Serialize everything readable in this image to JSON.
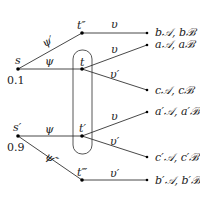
{
  "diagram": {
    "type": "game-tree",
    "nodes": {
      "s": {
        "label": "s",
        "prob": "0.1"
      },
      "s_prime": {
        "label": "s′",
        "prob": "0.9"
      },
      "t": {
        "label": "t"
      },
      "t_prime": {
        "label": "t′"
      },
      "t_dprime": {
        "label": "t″"
      },
      "t_tprime": {
        "label": "t‴"
      }
    },
    "edges": {
      "s_to_tdprime": "ψ′",
      "s_to_t": "ψ",
      "sprime_to_tprime": "ψ",
      "sprime_to_ttprime": "ψ″",
      "tdprime_to_b": "υ",
      "t_to_a": "υ",
      "t_to_c": "υ′",
      "tprime_to_aprime": "υ",
      "tprime_to_cprime": "υ′",
      "ttprime_to_bprime": "υ′"
    },
    "leaves": {
      "b": "b𝒜, bℬ",
      "a": "a𝒜, aℬ",
      "c": "c𝒜, cℬ",
      "a_prime": "a′𝒜, a′ℬ",
      "c_prime": "c′𝒜, c′ℬ",
      "b_prime": "b′𝒜, b′ℬ"
    },
    "information_set": "{t, t′}"
  }
}
